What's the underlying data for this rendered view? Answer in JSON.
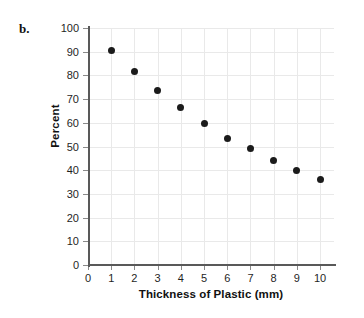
{
  "figure": {
    "part_label": "b.",
    "background_color": "#ffffff"
  },
  "chart_data": {
    "type": "scatter",
    "title": "",
    "xlabel": "Thickness of Plastic (mm)",
    "ylabel": "Percent",
    "xlim": [
      0,
      10.6
    ],
    "ylim": [
      0,
      100
    ],
    "grid": true,
    "legend": null,
    "marker_color": "#1b1b1b",
    "axis_color": "#595959",
    "grid_color": "#e9e9e9",
    "x_ticks": [
      0,
      1,
      2,
      3,
      4,
      5,
      6,
      7,
      8,
      9,
      10
    ],
    "x_tick_labels": [
      "0",
      "1",
      "2",
      "3",
      "4",
      "5",
      "6",
      "7",
      "8",
      "9",
      "10"
    ],
    "y_ticks": [
      0,
      10,
      20,
      30,
      40,
      50,
      60,
      70,
      80,
      90,
      100
    ],
    "y_tick_labels": [
      "0",
      "10",
      "20",
      "30",
      "40",
      "50",
      "60",
      "70",
      "80",
      "90",
      "100"
    ],
    "x": [
      1,
      2,
      3,
      4,
      5,
      6,
      7,
      8,
      9,
      10
    ],
    "y": [
      90.5,
      81.5,
      73.5,
      66.5,
      59.5,
      53.5,
      49,
      44,
      40,
      36
    ],
    "points": [
      {
        "x": 1,
        "y": 90.5
      },
      {
        "x": 2,
        "y": 81.5
      },
      {
        "x": 3,
        "y": 73.5
      },
      {
        "x": 4,
        "y": 66.5
      },
      {
        "x": 5,
        "y": 59.5
      },
      {
        "x": 6,
        "y": 53.5
      },
      {
        "x": 7,
        "y": 49
      },
      {
        "x": 8,
        "y": 44
      },
      {
        "x": 9,
        "y": 40
      },
      {
        "x": 10,
        "y": 36
      }
    ]
  }
}
